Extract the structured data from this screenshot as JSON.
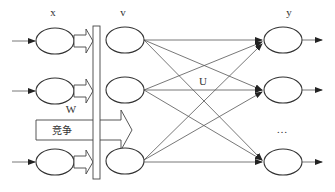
{
  "diagram": {
    "type": "competitive-neural-network",
    "layers": {
      "input": {
        "label": "x",
        "node_count_shown": 3
      },
      "middle": {
        "label": "v",
        "node_count_shown": 3
      },
      "output": {
        "label": "y",
        "node_count_shown": 3
      }
    },
    "weights": {
      "input_to_middle": "W",
      "middle_to_output": "U"
    },
    "competition_label": "竞争",
    "ellipsis": "…",
    "colors": {
      "stroke": "#333333",
      "background": "#ffffff"
    }
  }
}
